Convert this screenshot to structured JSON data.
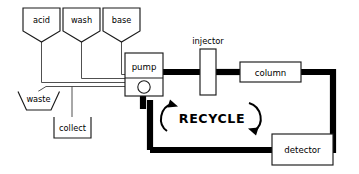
{
  "diagram": {
    "title": "RECYCLE",
    "type": "process-flow-diagram",
    "domain": "liquid-chromatography",
    "colors": {
      "background": "#ffffff",
      "outline": "#1a1a1a",
      "thin_pipe": "#3c3c3c",
      "thick_pipe": "#000000",
      "text": "#000000"
    },
    "reservoirs": [
      {
        "id": "acid",
        "label": "acid",
        "shape": "funnel-vessel"
      },
      {
        "id": "wash",
        "label": "wash",
        "shape": "funnel-vessel"
      },
      {
        "id": "base",
        "label": "base",
        "shape": "funnel-vessel"
      }
    ],
    "components": [
      {
        "id": "pump",
        "label": "pump",
        "shape": "box-with-circle"
      },
      {
        "id": "injector",
        "label": "injector",
        "shape": "tall-rect"
      },
      {
        "id": "column",
        "label": "column",
        "shape": "wide-rect"
      },
      {
        "id": "detector",
        "label": "detector",
        "shape": "wide-rect"
      }
    ],
    "outlets": [
      {
        "id": "waste",
        "label": "waste",
        "shape": "open-trapezoid"
      },
      {
        "id": "collect",
        "label": "collect",
        "shape": "open-rect"
      }
    ],
    "recycle_label": "RECYCLE",
    "flow_arrows": [
      {
        "id": "recycle-left",
        "direction": "counterclockwise-up"
      },
      {
        "id": "recycle-right",
        "direction": "counterclockwise-down"
      }
    ]
  }
}
